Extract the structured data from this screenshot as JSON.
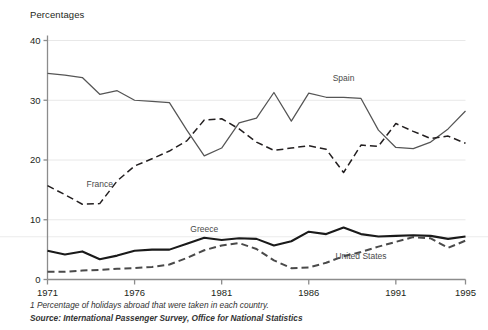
{
  "chart_data": {
    "type": "line",
    "title": "Percentages",
    "xlabel": "",
    "ylabel": "Percentages",
    "xlim": [
      1971,
      1995
    ],
    "ylim": [
      0,
      40
    ],
    "ytick_values": [
      0,
      10,
      20,
      30,
      40
    ],
    "ytick_labels": [
      "0",
      "10",
      "20",
      "30",
      "40"
    ],
    "xtick_values": [
      1971,
      1976,
      1981,
      1986,
      1991,
      1995
    ],
    "xtick_labels": [
      "1971",
      "1976",
      "1981",
      "1986",
      "1991",
      "1995"
    ],
    "grid": true,
    "legend_position": "inline-labels",
    "x": [
      1971,
      1972,
      1973,
      1974,
      1975,
      1976,
      1977,
      1978,
      1979,
      1980,
      1981,
      1982,
      1983,
      1984,
      1985,
      1986,
      1987,
      1988,
      1989,
      1990,
      1991,
      1992,
      1993,
      1994,
      1995
    ],
    "series": [
      {
        "name": "Spain",
        "style": "solid",
        "color": "#555555",
        "label_x": 1988,
        "label_y": 33.2,
        "values": [
          34.5,
          34.2,
          33.8,
          31.0,
          31.6,
          30.0,
          29.8,
          29.6,
          25.0,
          20.7,
          22.0,
          26.2,
          27.0,
          31.3,
          26.5,
          31.2,
          30.5,
          30.5,
          30.3,
          25.0,
          22.1,
          21.9,
          23.0,
          25.2,
          28.2
        ]
      },
      {
        "name": "France",
        "style": "dashed",
        "color": "#231f20",
        "label_x": 1974,
        "label_y": 15.5,
        "values": [
          15.7,
          14.2,
          12.6,
          12.7,
          16.5,
          19.0,
          20.2,
          21.5,
          23.2,
          26.7,
          26.9,
          25.2,
          23.0,
          21.6,
          22.0,
          22.4,
          21.8,
          17.9,
          22.5,
          22.3,
          26.1,
          24.8,
          23.6,
          24.0,
          22.8
        ]
      },
      {
        "name": "Greece",
        "style": "solid-bold",
        "color": "#1a1a1a",
        "label_x": 1980,
        "label_y": 8.0,
        "values": [
          4.8,
          4.2,
          4.7,
          3.4,
          4.0,
          4.8,
          5.0,
          5.0,
          6.0,
          7.0,
          6.6,
          6.9,
          6.8,
          5.7,
          6.4,
          8.0,
          7.6,
          8.7,
          7.6,
          7.2,
          7.3,
          7.4,
          7.3,
          6.8,
          7.2
        ]
      },
      {
        "name": "United States",
        "style": "dashed-bold",
        "color": "#4a4a4a",
        "label_x": 1989,
        "label_y": 3.4,
        "values": [
          1.3,
          1.3,
          1.5,
          1.6,
          1.8,
          1.9,
          2.1,
          2.5,
          3.6,
          4.9,
          5.7,
          6.1,
          5.1,
          3.2,
          1.9,
          2.0,
          2.8,
          3.9,
          4.6,
          5.5,
          6.3,
          7.1,
          6.9,
          5.3,
          6.5
        ]
      }
    ]
  },
  "footnotes": {
    "note1": "1 Percentage of holidays abroad that were taken in each country.",
    "source": "Source: International Passenger Survey, Office for National Statistics"
  }
}
